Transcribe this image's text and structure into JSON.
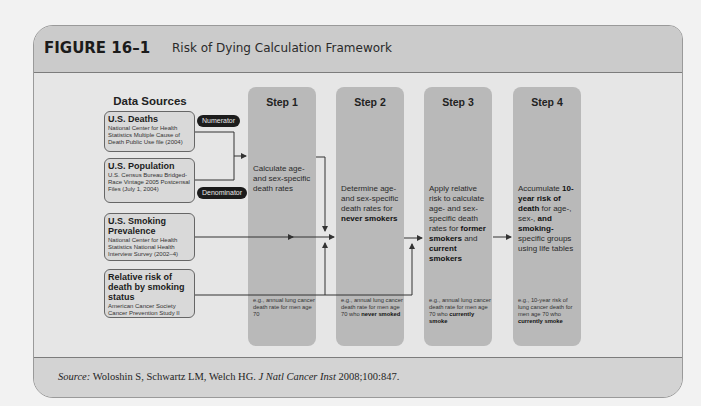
{
  "figure": {
    "label": "FIGURE 16–1",
    "title": "Risk of Dying Calculation Framework"
  },
  "data_sources": {
    "heading": "Data Sources",
    "items": [
      {
        "name": "U.S. Deaths",
        "detail": "National Center for Health Statistics Multiple Cause of Death Public Use file (2004)"
      },
      {
        "name": "U.S. Population",
        "detail": "U.S. Census Bureau Bridged-Race Vintage 2005 Postcensal Files (July 1, 2004)"
      },
      {
        "name": "U.S. Smoking Prevalence",
        "detail": "National Center for Health Statistics National Health Interview Survey (2002–4)"
      },
      {
        "name": "Relative risk of death by smoking status",
        "detail": "American Cancer Society Cancer Prevention Study II"
      }
    ],
    "numerator_label": "Numerator",
    "denominator_label": "Denominator"
  },
  "steps": [
    {
      "title": "Step 1",
      "text_parts": [
        {
          "t": "Calculate age- and sex-specific death rates",
          "b": false
        }
      ],
      "example_parts": [
        {
          "t": "e.g., annual lung cancer death rate for men age 70",
          "b": false
        }
      ]
    },
    {
      "title": "Step 2",
      "text_parts": [
        {
          "t": "Determine age- and sex-specific death rates for ",
          "b": false
        },
        {
          "t": "never smokers",
          "b": true
        }
      ],
      "example_parts": [
        {
          "t": "e.g., annual lung cancer death rate for men age 70 who ",
          "b": false
        },
        {
          "t": "never smoked",
          "b": true
        }
      ]
    },
    {
      "title": "Step 3",
      "text_parts": [
        {
          "t": "Apply relative risk to calculate age- and sex-specific death rates for ",
          "b": false
        },
        {
          "t": "former smokers",
          "b": true
        },
        {
          "t": " and ",
          "b": false
        },
        {
          "t": "current smokers",
          "b": true
        }
      ],
      "example_parts": [
        {
          "t": "e.g., annual lung cancer death rate for men age 70 who ",
          "b": false
        },
        {
          "t": "currently smoke",
          "b": true
        }
      ]
    },
    {
      "title": "Step 4",
      "text_parts": [
        {
          "t": "Accumulate ",
          "b": false
        },
        {
          "t": "10-year risk of death",
          "b": true
        },
        {
          "t": " for age-, sex-, ",
          "b": false
        },
        {
          "t": "and smoking-",
          "b": true
        },
        {
          "t": "specific groups using life tables",
          "b": false
        }
      ],
      "example_parts": [
        {
          "t": "e.g., 10-year risk of lung cancer death for men age 70 who ",
          "b": false
        },
        {
          "t": "currently smoke",
          "b": true
        }
      ]
    }
  ],
  "source": {
    "label": "Source:",
    "authors": " Woloshin S, Schwartz LM, Welch HG. ",
    "journal": "J Natl Cancer Inst",
    "citation": " 2008;100:847."
  },
  "colors": {
    "header_band": "#cbcbcb",
    "body": "#e6e6e6",
    "step_column": "#b9b9b9",
    "source_box": "#d9d9d9",
    "pill": "#1c1c1c",
    "line": "#333333"
  }
}
